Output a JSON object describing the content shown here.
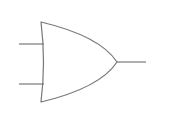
{
  "diagram": {
    "type": "logic-gate",
    "gate": "OR",
    "stroke_color": "#777777",
    "background": "#ffffff",
    "inputs": [
      {
        "name": "input-a",
        "x1": 19,
        "y1": 44,
        "x2": 44,
        "y2": 44
      },
      {
        "name": "input-b",
        "x1": 19,
        "y1": 84,
        "x2": 44,
        "y2": 84
      }
    ],
    "output": {
      "name": "output",
      "x1": 117,
      "y1": 62,
      "x2": 146,
      "y2": 62
    }
  }
}
